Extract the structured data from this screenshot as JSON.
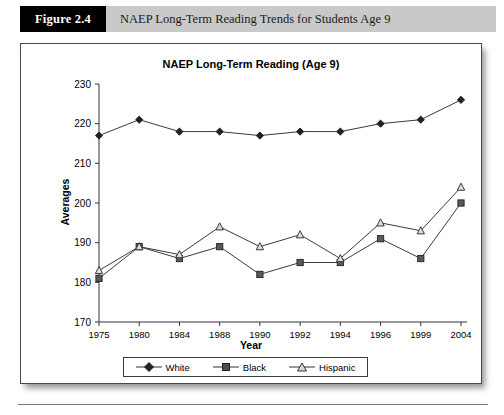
{
  "figure": {
    "number_label": "Figure 2.4",
    "caption": "NAEP Long-Term Reading Trends for Students Age 9"
  },
  "chart_data": {
    "type": "line",
    "title": "NAEP Long-Term Reading (Age 9)",
    "xlabel": "Year",
    "ylabel": "Averages",
    "categories": [
      "1975",
      "1980",
      "1984",
      "1988",
      "1990",
      "1992",
      "1994",
      "1996",
      "1999",
      "2004"
    ],
    "ylim": [
      170,
      230
    ],
    "yticks": [
      "170",
      "180",
      "190",
      "200",
      "210",
      "220",
      "230"
    ],
    "grid": false,
    "legend_position": "bottom",
    "series": [
      {
        "name": "White",
        "marker": "filled-diamond",
        "color": "#333333",
        "values": [
          217,
          221,
          218,
          218,
          217,
          218,
          218,
          220,
          221,
          226
        ]
      },
      {
        "name": "Black",
        "marker": "filled-square",
        "color": "#555555",
        "values": [
          181,
          189,
          186,
          189,
          182,
          185,
          185,
          191,
          186,
          200
        ]
      },
      {
        "name": "Hispanic",
        "marker": "open-triangle",
        "color": "#555555",
        "values": [
          183,
          189,
          187,
          194,
          189,
          192,
          186,
          195,
          193,
          204
        ]
      }
    ]
  }
}
